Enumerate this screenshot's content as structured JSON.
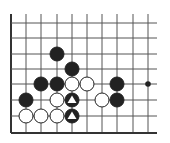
{
  "diagram": {
    "type": "go-board-fragment",
    "colors": {
      "background": "#ffffff",
      "line": "#555555",
      "edge": "#333333",
      "black": "#222222",
      "white": "#ffffff",
      "marker": "#ffffff"
    },
    "grid": {
      "columns_x": [
        11,
        26,
        41,
        57,
        72,
        87,
        102,
        117,
        133,
        148
      ],
      "rows_y": [
        23,
        38,
        54,
        69,
        84,
        100,
        116,
        133
      ],
      "top_extent": 14,
      "right_extent": 157,
      "left_edge": true,
      "bottom_edge": true
    },
    "stones": [
      {
        "color": "black",
        "col": 3,
        "row": 2,
        "mark": ""
      },
      {
        "color": "black",
        "col": 4,
        "row": 3,
        "mark": ""
      },
      {
        "color": "black",
        "col": 2,
        "row": 4,
        "mark": ""
      },
      {
        "color": "black",
        "col": 3,
        "row": 4,
        "mark": ""
      },
      {
        "color": "white",
        "col": 4,
        "row": 4,
        "mark": ""
      },
      {
        "color": "white",
        "col": 5,
        "row": 4,
        "mark": ""
      },
      {
        "color": "black",
        "col": 7,
        "row": 4,
        "mark": ""
      },
      {
        "color": "black",
        "col": 1,
        "row": 5,
        "mark": ""
      },
      {
        "color": "white",
        "col": 3,
        "row": 5,
        "mark": ""
      },
      {
        "color": "black",
        "col": 4,
        "row": 5,
        "mark": "triangle"
      },
      {
        "color": "white",
        "col": 6,
        "row": 5,
        "mark": ""
      },
      {
        "color": "black",
        "col": 7,
        "row": 5,
        "mark": ""
      },
      {
        "color": "white",
        "col": 1,
        "row": 6,
        "mark": ""
      },
      {
        "color": "white",
        "col": 2,
        "row": 6,
        "mark": ""
      },
      {
        "color": "white",
        "col": 3,
        "row": 6,
        "mark": ""
      },
      {
        "color": "black",
        "col": 4,
        "row": 6,
        "mark": "triangle"
      }
    ],
    "markers": [
      {
        "type": "dot",
        "col": 9,
        "row": 4
      }
    ]
  }
}
